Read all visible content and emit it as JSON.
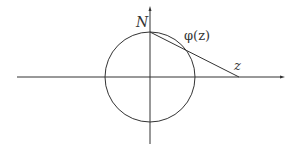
{
  "diagram": {
    "labels": {
      "north_pole": "N",
      "projection": "φ(z)",
      "point": "z"
    },
    "geometry": {
      "circle_center": [
        150,
        77
      ],
      "circle_radius": 45,
      "north_pole": [
        150,
        32
      ],
      "point_z": [
        239,
        77
      ],
      "projection_point": [
        186,
        50
      ],
      "x_axis": {
        "from": [
          17,
          77
        ],
        "to": [
          284,
          77
        ]
      },
      "y_axis": {
        "from": [
          150,
          144
        ],
        "to": [
          150,
          7
        ]
      }
    },
    "colors": {
      "stroke": "#333333",
      "background": "#ffffff"
    }
  }
}
